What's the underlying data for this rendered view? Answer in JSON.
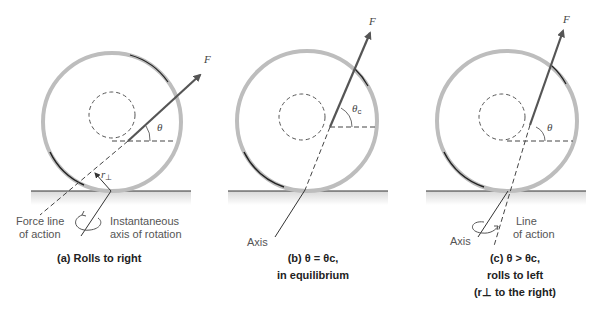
{
  "panels": [
    {
      "id": "a",
      "force_symbol": "F",
      "angle_symbol": "θ",
      "r_perp_symbol": "r",
      "r_perp_sub": "⊥",
      "labels": {
        "force_line_1": "Force line",
        "force_line_2": "of action",
        "axis_1": "Instantaneous",
        "axis_2": "axis of rotation"
      },
      "caption": [
        "(a) Rolls to right"
      ]
    },
    {
      "id": "b",
      "force_symbol": "F",
      "angle_symbol": "θ",
      "angle_sub": "c",
      "labels": {
        "axis": "Axis"
      },
      "caption": [
        "(b) θ = θc,",
        "in equilibrium"
      ]
    },
    {
      "id": "c",
      "force_symbol": "F",
      "angle_symbol": "θ",
      "labels": {
        "axis": "Axis",
        "line_1": "Line",
        "line_2": "of action"
      },
      "caption": [
        "(c) θ > θc,",
        "rolls to left",
        "(r⊥ to the right)"
      ]
    }
  ],
  "colors": {
    "rim": "#b8b8b8",
    "rim_dark": "#222222",
    "arrow": "#555555",
    "ground": "#333333",
    "dash": "#444444"
  }
}
